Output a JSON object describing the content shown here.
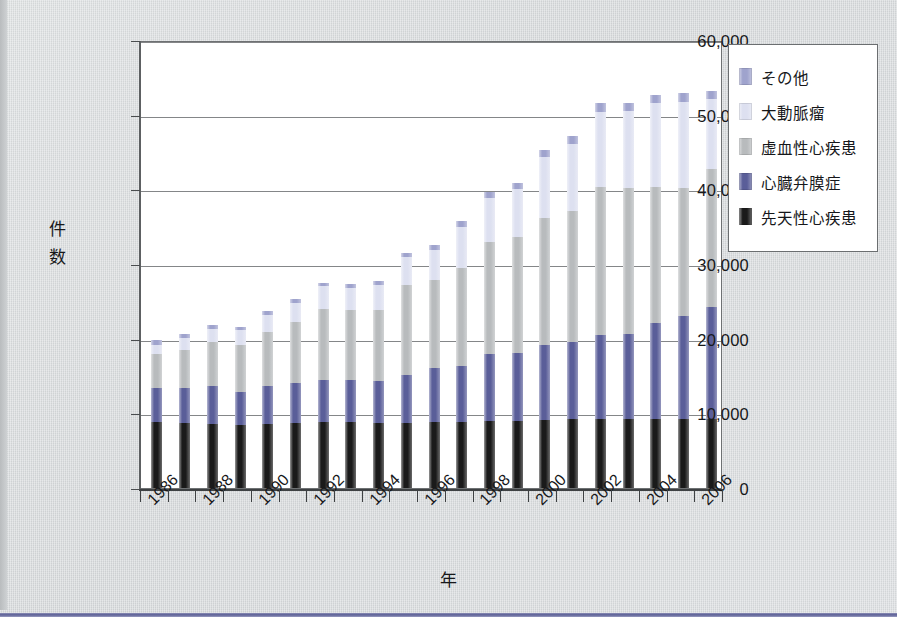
{
  "chart_data": {
    "type": "bar",
    "title": "",
    "xlabel": "年",
    "ylabel": "件数",
    "ylim": [
      0,
      60000
    ],
    "ytick_step": 10000,
    "ytick_labels": [
      "60,000",
      "50,000",
      "40,000",
      "30,000",
      "20,000",
      "10,000",
      "0"
    ],
    "ytick_values": [
      60000,
      50000,
      40000,
      30000,
      20000,
      10000,
      0
    ],
    "grid": true,
    "stacked": true,
    "legend_position": "right",
    "x": [
      1986,
      1987,
      1988,
      1989,
      1990,
      1991,
      1992,
      1993,
      1994,
      1995,
      1996,
      1997,
      1998,
      1999,
      2000,
      2001,
      2002,
      2003,
      2004,
      2005,
      2006
    ],
    "xtick_labels": [
      "1986",
      "1988",
      "1990",
      "1992",
      "1994",
      "1996",
      "1998",
      "2000",
      "2002",
      "2004",
      "2006"
    ],
    "series": [
      {
        "name": "先天性心疾患",
        "color": "#1a1a1a",
        "values": [
          8800,
          8700,
          8600,
          8500,
          8600,
          8700,
          8800,
          8800,
          8700,
          8700,
          8800,
          8900,
          9000,
          9000,
          9100,
          9200,
          9200,
          9200,
          9200,
          9300,
          9300
        ]
      },
      {
        "name": "心臓弁膜症",
        "color": "#5a5e99",
        "values": [
          4600,
          4700,
          5000,
          4300,
          5000,
          5400,
          5700,
          5700,
          5600,
          6500,
          7300,
          7400,
          9000,
          9100,
          10000,
          10400,
          11300,
          11400,
          12900,
          13800,
          14900
        ]
      },
      {
        "name": "虚血性心疾患",
        "color": "#b8bbbd",
        "values": [
          4500,
          5100,
          5900,
          6300,
          7300,
          8100,
          9500,
          9300,
          9600,
          12000,
          11700,
          13200,
          14900,
          15500,
          17100,
          17500,
          19800,
          19600,
          18200,
          17100,
          18500
        ]
      },
      {
        "name": "大動脈瘤",
        "color": "#dde0f0",
        "values": [
          1300,
          1600,
          1800,
          2000,
          2300,
          2600,
          3000,
          3000,
          3300,
          3700,
          4100,
          5500,
          6000,
          6500,
          8100,
          9000,
          10000,
          10300,
          11200,
          11500,
          9400
        ]
      },
      {
        "name": "その他",
        "color": "#9fa3cd",
        "values": [
          600,
          500,
          500,
          500,
          500,
          500,
          500,
          500,
          500,
          600,
          600,
          700,
          700,
          700,
          1000,
          1000,
          1200,
          1100,
          1100,
          1200,
          1100
        ]
      }
    ],
    "totals": [
      19800,
      20600,
      21800,
      21600,
      23700,
      25300,
      27500,
      27300,
      27700,
      31500,
      32500,
      36700,
      39600,
      40800,
      45300,
      47100,
      51500,
      51600,
      52600,
      52900,
      53200
    ]
  },
  "legend": {
    "items": [
      {
        "label": "その他",
        "color": "#9fa3cd"
      },
      {
        "label": "大動脈瘤",
        "color": "#dde0f0"
      },
      {
        "label": "虚血性心疾患",
        "color": "#b8bbbd"
      },
      {
        "label": "心臓弁膜症",
        "color": "#5a5e99"
      },
      {
        "label": "先天性心疾患",
        "color": "#1a1a1a"
      }
    ]
  },
  "axes": {
    "y_title": "件数",
    "y_title_chars": [
      "件",
      "数"
    ],
    "x_title": "年"
  },
  "colors": {
    "page_background": "#d7dadb",
    "plot_background": "#ffffff",
    "frame": "#6e7173",
    "gridline": "#6e7173",
    "text": "#17181a",
    "bottom_rule": "#5b5f96"
  }
}
